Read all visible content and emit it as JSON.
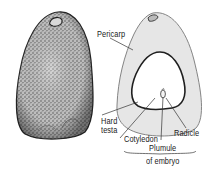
{
  "figure": {
    "left_view": {
      "description": "Whole seed exterior (stippled)"
    },
    "right_view": {
      "description": "Longitudinal section"
    },
    "labels": {
      "pericarp": "Pericarp",
      "hard_testa_line1": "Hard",
      "hard_testa_line2": "testa",
      "cotyledon": "Cotyledon",
      "radicle": "Radicle",
      "plumule": "Plumule",
      "of_embryo": "of embryo"
    },
    "colors": {
      "stipple_dark": "#3a3a3a",
      "pericarp_fill": "#e6e6e6",
      "outline": "#2a2a2a",
      "background": "#ffffff"
    }
  }
}
